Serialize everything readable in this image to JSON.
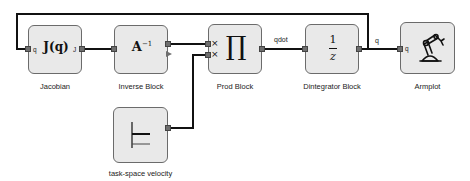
{
  "diagram": {
    "blocks": {
      "jacobian": {
        "label": "Jacobian",
        "symbol": "J(q)",
        "in_port": "q",
        "out_port": "J"
      },
      "inverse": {
        "label": "Inverse Block",
        "symbol": "A",
        "symbol_sup": "−1"
      },
      "prod": {
        "label": "Prod Block",
        "symbol": "∏",
        "op1": "×",
        "op2": "×"
      },
      "integrator": {
        "label": "Dintegrator Block",
        "num": "1",
        "den": "z"
      },
      "armplot": {
        "label": "Armplot",
        "in_port": "q"
      },
      "velocity": {
        "label": "task-space velocity"
      }
    },
    "wires": {
      "prod_to_integrator": "qdot",
      "integrator_to_armplot": "q"
    },
    "colors": {
      "block_fill": "#e9e9e9",
      "block_border": "#6b6b6b",
      "wire": "#111111",
      "port": "#6e6e6e"
    }
  }
}
